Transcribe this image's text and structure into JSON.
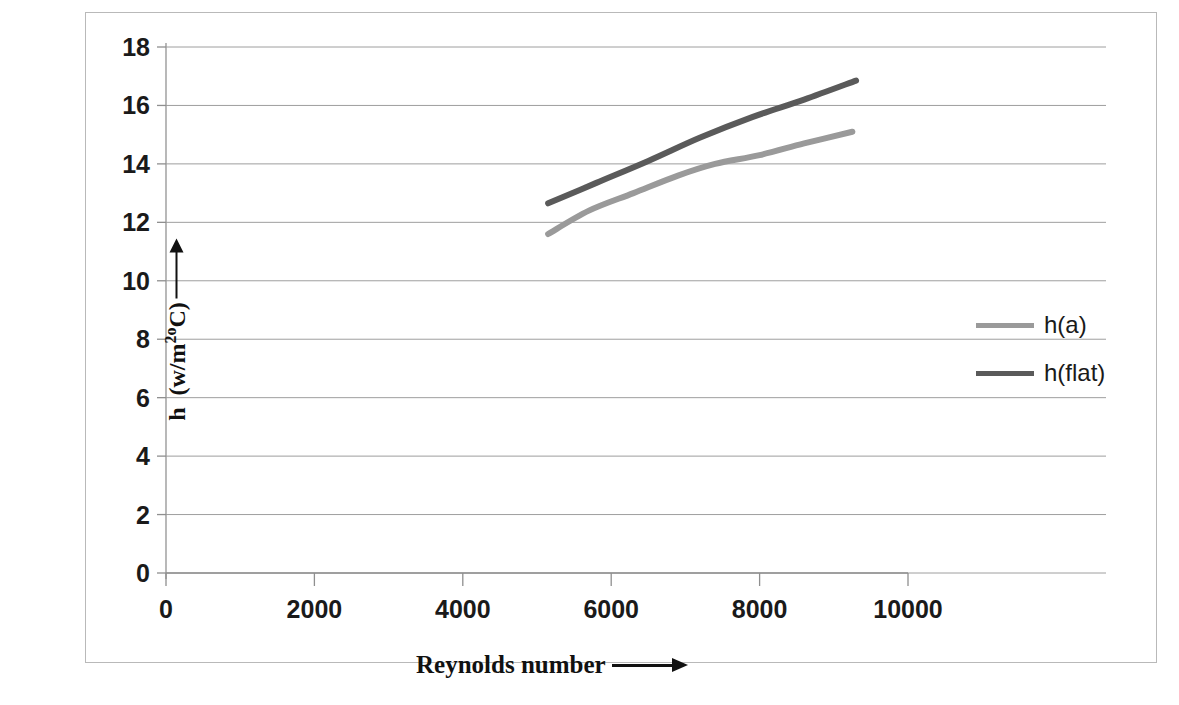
{
  "chart_data": {
    "type": "line",
    "title": "",
    "xlabel": "Reynolds number",
    "ylabel": "h (w/m2oC)",
    "xlim": [
      0,
      10000
    ],
    "ylim": [
      0,
      18
    ],
    "grid": true,
    "legend_position": "right",
    "x_ticks": [
      "0",
      "2000",
      "4000",
      "6000",
      "8000",
      "10000"
    ],
    "x_tick_values": [
      0,
      2000,
      4000,
      6000,
      8000,
      10000
    ],
    "y_ticks": [
      "0",
      "2",
      "4",
      "6",
      "8",
      "10",
      "12",
      "14",
      "16",
      "18"
    ],
    "y_tick_values": [
      0,
      2,
      4,
      6,
      8,
      10,
      12,
      14,
      16,
      18
    ],
    "series": [
      {
        "name": "h(a)",
        "color": "#9a9a9a",
        "x": [
          5150,
          5700,
          6300,
          6900,
          7400,
          8000,
          8600,
          9250
        ],
        "values": [
          11.6,
          12.4,
          13.0,
          13.6,
          14.0,
          14.3,
          14.7,
          15.1
        ]
      },
      {
        "name": "h(flat)",
        "color": "#5a5a5a",
        "x": [
          5150,
          5800,
          6500,
          7200,
          7900,
          8600,
          9300
        ],
        "values": [
          12.65,
          13.35,
          14.1,
          14.9,
          15.6,
          16.2,
          16.85
        ]
      }
    ]
  },
  "axes": {
    "x_axis_arrow": "arrow-right",
    "y_axis_arrow": "arrow-up",
    "ylabel_main": "h",
    "ylabel_unit_open": "(w/m",
    "ylabel_unit_sup": "2o",
    "ylabel_unit_close": "C)"
  },
  "legend": {
    "items": [
      {
        "label": "h(a)",
        "color": "#9a9a9a"
      },
      {
        "label": "h(flat)",
        "color": "#5a5a5a"
      }
    ]
  }
}
